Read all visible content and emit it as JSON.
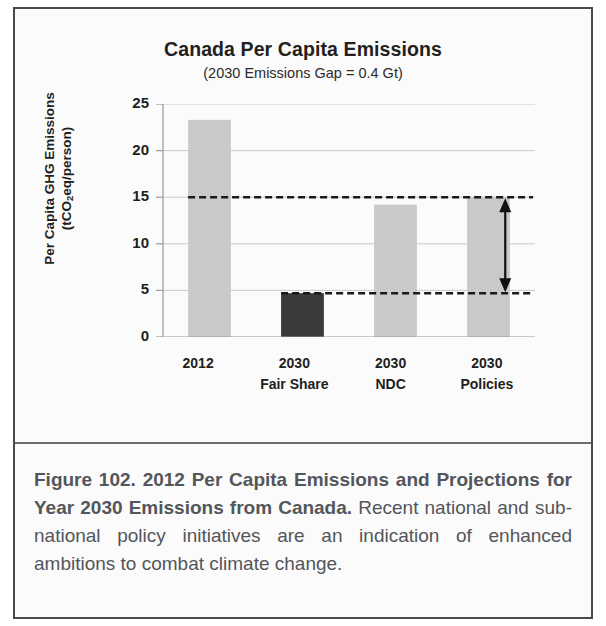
{
  "figure": {
    "caption_title": "Figure 102. 2012 Per Capita Emissions and Projections for Year 2030 Emissions from Canada.",
    "caption_body": "Recent national and sub-national policy initiatives are an indication of enhanced ambitions to combat climate change."
  },
  "chart_data": {
    "type": "bar",
    "title": "Canada Per Capita Emissions",
    "subtitle": "(2030 Emissions Gap  = 0.4 Gt)",
    "ylabel_line1": "Per Capita GHG Emissions",
    "ylabel_line2_pre": "(tCO",
    "ylabel_line2_sub": "2",
    "ylabel_line2_post": "eq/person)",
    "xlabel": "",
    "categories": [
      "2012",
      "2030 Fair Share",
      "2030 NDC",
      "2030 Policies"
    ],
    "category_lines": [
      [
        "2012",
        ""
      ],
      [
        "2030",
        "Fair Share"
      ],
      [
        "2030",
        "NDC"
      ],
      [
        "2030",
        "Policies"
      ]
    ],
    "values": [
      23.3,
      4.7,
      14.2,
      15.0
    ],
    "bar_colors": [
      "#c9c9c9",
      "#3a3a3a",
      "#c9c9c9",
      "#c9c9c9"
    ],
    "ylim": [
      0,
      25
    ],
    "ytick_values": [
      25,
      20,
      15,
      10,
      5,
      0
    ],
    "ytick_labels": [
      "25",
      "20",
      "15",
      "10",
      "5",
      "0"
    ],
    "grid": true,
    "legend": "none",
    "annotations": [
      {
        "name": "upper-gap-line",
        "type": "dashed-hline",
        "value": 15.0,
        "from_category_index": 0,
        "color": "#1a1a1a"
      },
      {
        "name": "lower-gap-line",
        "type": "dashed-hline",
        "value": 4.7,
        "from_category_index": 1,
        "color": "#1a1a1a"
      },
      {
        "name": "emissions-gap-arrow",
        "type": "double-arrow",
        "y_top": 15.0,
        "y_bottom": 4.7,
        "x_position": 0.92,
        "color": "#111111"
      }
    ]
  }
}
